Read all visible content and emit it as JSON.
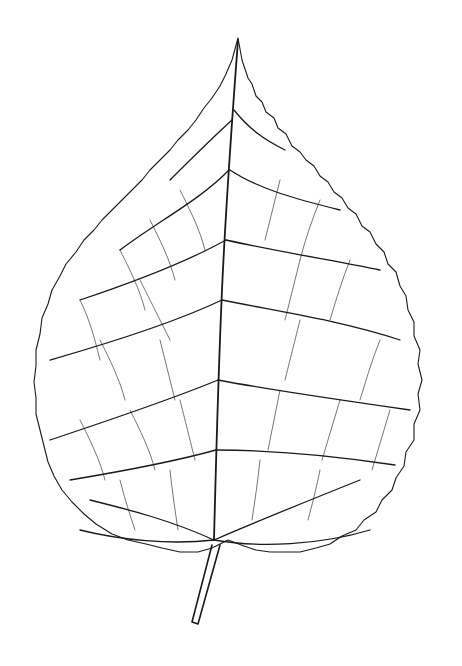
{
  "image": {
    "subject": "leaf venation line drawing",
    "description": "Botanical pen illustration of a broad, heart-ovate leaf with serrated margin, acuminate tip, prominent midrib, pinnate secondary veins and dense reticulate tertiary veins; short petiole at bottom.",
    "colors": {
      "background": "#ffffff",
      "ink": "#1a1a1a"
    }
  }
}
